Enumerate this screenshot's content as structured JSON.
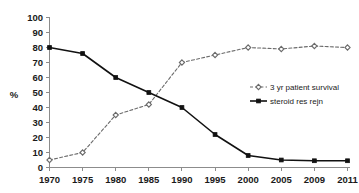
{
  "chart_data": {
    "type": "line",
    "title": "",
    "xlabel": "",
    "ylabel": "%",
    "categories": [
      "1970",
      "1975",
      "1980",
      "1985",
      "1990",
      "1995",
      "2000",
      "2005",
      "2009",
      "2011"
    ],
    "ylim": [
      0,
      100
    ],
    "ytick_step": 10,
    "yticks": [
      "0",
      "10",
      "20",
      "30",
      "40",
      "50",
      "60",
      "70",
      "80",
      "90",
      "100"
    ],
    "grid": false,
    "legend_position": "center-right",
    "series": [
      {
        "name": "3 yr patient survival",
        "values": [
          5,
          10,
          35,
          42,
          70,
          75,
          80,
          79,
          81,
          80
        ],
        "color": "#6b6b6b",
        "style": "dashed",
        "marker": "diamond"
      },
      {
        "name": "steroid res rejn",
        "values": [
          80,
          76,
          60,
          50,
          40,
          22,
          8,
          5,
          4.5,
          4.5
        ],
        "color": "#111111",
        "style": "solid",
        "marker": "square"
      }
    ]
  },
  "axes": {
    "y_axis_label": "%",
    "y_tick_labels": [
      "100",
      "90",
      "80",
      "70",
      "60",
      "50",
      "40",
      "30",
      "20",
      "10",
      "0"
    ],
    "x_tick_labels": [
      "1970",
      "1975",
      "1980",
      "1985",
      "1990",
      "1995",
      "2000",
      "2005",
      "2009",
      "2011"
    ]
  },
  "legend": {
    "entries": [
      {
        "label": "3 yr patient survival",
        "marker": "diamond-dashed-icon"
      },
      {
        "label": "steroid res rejn",
        "marker": "square-solid-icon"
      }
    ]
  }
}
